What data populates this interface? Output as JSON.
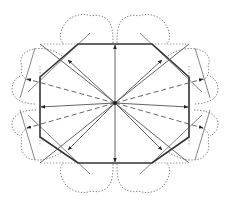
{
  "diagram": {
    "center": [
      115,
      103
    ],
    "colors": {
      "edge": "#333333",
      "ray": "#555555",
      "lobe": "#777777",
      "background": "#ffffff"
    },
    "octagon_vertices": [
      [
        78,
        44
      ],
      [
        152,
        44
      ],
      [
        189,
        77
      ],
      [
        189,
        137
      ],
      [
        152,
        163
      ],
      [
        78,
        163
      ],
      [
        40,
        137
      ],
      [
        40,
        77
      ]
    ],
    "solid_rays": [
      {
        "name": "ray-top",
        "to": [
          115,
          45
        ]
      },
      {
        "name": "ray-bottom",
        "to": [
          115,
          162
        ]
      },
      {
        "name": "ray-left",
        "to": [
          41,
          107
        ]
      },
      {
        "name": "ray-right",
        "to": [
          188,
          107
        ]
      },
      {
        "name": "ray-upper-left",
        "to": [
          68,
          60
        ]
      },
      {
        "name": "ray-upper-right",
        "to": [
          162,
          60
        ]
      },
      {
        "name": "ray-lower-left",
        "to": [
          68,
          150
        ]
      },
      {
        "name": "ray-lower-right",
        "to": [
          162,
          150
        ]
      }
    ],
    "dashed_rays": [
      {
        "name": "dashed-ray-upper-left",
        "to": [
          27,
          79
        ]
      },
      {
        "name": "dashed-ray-lower-left",
        "to": [
          27,
          128
        ]
      },
      {
        "name": "dashed-ray-upper-right",
        "to": [
          203,
          79
        ]
      },
      {
        "name": "dashed-ray-lower-right",
        "to": [
          203,
          128
        ]
      }
    ],
    "edge_count": 8,
    "lobe_count": 12
  }
}
